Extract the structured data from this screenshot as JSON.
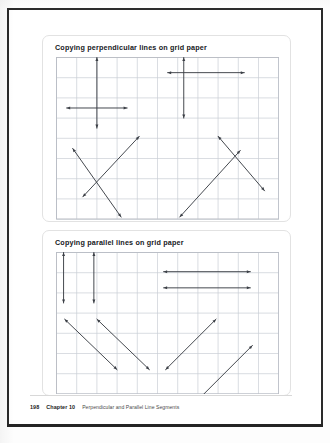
{
  "page": {
    "footer": {
      "page_number": "198",
      "chapter_label": "Chapter 10",
      "chapter_title": "Perpendicular and Parallel Line Segments"
    }
  },
  "panels": [
    {
      "id": "perpendicular",
      "title": "Copying perpendicular lines on grid paper",
      "grid": {
        "cols": 11,
        "rows": 8,
        "cell": 20.2,
        "line_color": "#c9cdd4",
        "border_color": "#b8bcc4"
      },
      "figures": [
        {
          "name": "cross-left",
          "type": "perpendicular-cross",
          "segments": [
            {
              "x1": 2.0,
              "y1": 0.0,
              "x2": 2.0,
              "y2": 3.5,
              "arrow_start": true,
              "arrow_end": true
            },
            {
              "x1": 0.5,
              "y1": 2.5,
              "x2": 3.5,
              "y2": 2.5,
              "arrow_start": true,
              "arrow_end": true
            }
          ]
        },
        {
          "name": "cross-right",
          "type": "perpendicular-cross",
          "segments": [
            {
              "x1": 6.3,
              "y1": 0.0,
              "x2": 6.3,
              "y2": 3.0,
              "arrow_start": true,
              "arrow_end": true
            },
            {
              "x1": 5.5,
              "y1": 0.75,
              "x2": 9.3,
              "y2": 0.75,
              "arrow_start": true,
              "arrow_end": true
            }
          ]
        },
        {
          "name": "x-cross-left",
          "type": "perpendicular-x",
          "segments": [
            {
              "x1": 0.8,
              "y1": 4.5,
              "x2": 3.2,
              "y2": 7.9,
              "arrow_start": true,
              "arrow_end": true
            },
            {
              "x1": 1.3,
              "y1": 6.9,
              "x2": 4.1,
              "y2": 3.9,
              "arrow_start": true,
              "arrow_end": true
            }
          ]
        },
        {
          "name": "x-cross-right",
          "type": "perpendicular-x",
          "segments": [
            {
              "x1": 6.1,
              "y1": 7.9,
              "x2": 9.1,
              "y2": 4.6,
              "arrow_start": true,
              "arrow_end": true
            },
            {
              "x1": 8.0,
              "y1": 3.9,
              "x2": 10.3,
              "y2": 6.6,
              "arrow_start": true,
              "arrow_end": true
            }
          ]
        }
      ]
    },
    {
      "id": "parallel",
      "title": "Copying parallel lines on grid paper",
      "grid": {
        "cols": 11,
        "rows": 7,
        "cell": 20.2,
        "line_color": "#c9cdd4",
        "border_color": "#b8bcc4"
      },
      "figures": [
        {
          "name": "vertical-pair",
          "type": "parallel-vertical",
          "segments": [
            {
              "x1": 0.35,
              "y1": 0.0,
              "x2": 0.35,
              "y2": 2.5,
              "arrow_start": true,
              "arrow_end": true
            },
            {
              "x1": 1.85,
              "y1": 0.0,
              "x2": 1.85,
              "y2": 2.5,
              "arrow_start": true,
              "arrow_end": true
            }
          ]
        },
        {
          "name": "horizontal-pair",
          "type": "parallel-horizontal",
          "segments": [
            {
              "x1": 5.3,
              "y1": 0.95,
              "x2": 9.6,
              "y2": 0.95,
              "arrow_start": true,
              "arrow_end": true
            },
            {
              "x1": 5.3,
              "y1": 1.75,
              "x2": 9.6,
              "y2": 1.75,
              "arrow_start": true,
              "arrow_end": true
            }
          ]
        },
        {
          "name": "diagonal-down-pair",
          "type": "parallel-diagonal",
          "segments": [
            {
              "x1": 0.4,
              "y1": 3.3,
              "x2": 3.0,
              "y2": 5.8,
              "arrow_start": true,
              "arrow_end": true
            },
            {
              "x1": 2.0,
              "y1": 3.3,
              "x2": 4.6,
              "y2": 5.8,
              "arrow_start": true,
              "arrow_end": true
            }
          ]
        },
        {
          "name": "diagonal-up-pair",
          "type": "parallel-diagonal",
          "segments": [
            {
              "x1": 5.4,
              "y1": 5.8,
              "x2": 7.9,
              "y2": 3.3,
              "arrow_start": true,
              "arrow_end": true
            },
            {
              "x1": 7.1,
              "y1": 7.2,
              "x2": 9.7,
              "y2": 4.6,
              "arrow_start": true,
              "arrow_end": true
            }
          ]
        }
      ]
    }
  ],
  "colors": {
    "stroke": "#3b3f46",
    "grid": "#c9cdd4",
    "panel_border": "#e2e2e2",
    "page_border": "#2a2a2a"
  }
}
